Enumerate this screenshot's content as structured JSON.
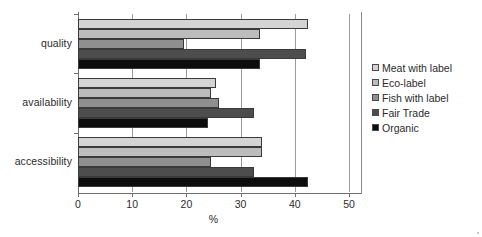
{
  "chart_data": {
    "type": "bar",
    "orientation": "horizontal",
    "title": "",
    "xlabel": "%",
    "ylabel": "",
    "xlim": [
      0,
      50
    ],
    "xticks": [
      0,
      10,
      20,
      30,
      40,
      50
    ],
    "grid": true,
    "legend_position": "right",
    "categories": [
      "quality",
      "availability",
      "accessibility"
    ],
    "series": [
      {
        "name": "Meat with label",
        "color": "#d4d4d4",
        "values": [
          42.5,
          25.5,
          34.0
        ]
      },
      {
        "name": "Eco-label",
        "color": "#bcbcbc",
        "values": [
          33.5,
          24.5,
          34.0
        ]
      },
      {
        "name": "Fish with label",
        "color": "#8f8f8f",
        "values": [
          19.5,
          26.0,
          24.5
        ]
      },
      {
        "name": "Fair Trade",
        "color": "#4d4d4d",
        "values": [
          42.0,
          32.5,
          32.5
        ]
      },
      {
        "name": "Organic",
        "color": "#0d0d0d",
        "values": [
          33.5,
          24.0,
          42.5
        ]
      }
    ]
  },
  "axis": {
    "x_title": "%",
    "tick_labels": [
      "0",
      "10",
      "20",
      "30",
      "40",
      "50"
    ],
    "category_labels": [
      "quality",
      "availability",
      "accessibility"
    ]
  },
  "legend": {
    "items": [
      {
        "label": "Meat with label"
      },
      {
        "label": "Eco-label"
      },
      {
        "label": "Fish with label"
      },
      {
        "label": "Fair Trade"
      },
      {
        "label": "Organic"
      }
    ]
  }
}
